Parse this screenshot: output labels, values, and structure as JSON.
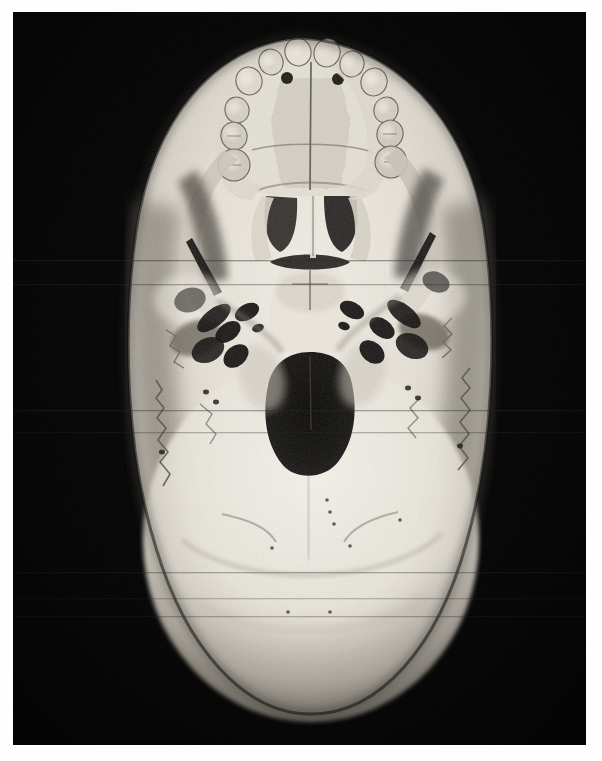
{
  "page": {
    "background_color": "#ffffff",
    "width": 602,
    "height": 761,
    "caption": ""
  },
  "photograph": {
    "name": "human-skull-base-inferior-view",
    "description": "Black and white anatomical photograph of a dry human skull viewed from below (norma basalis), lit from above, on a black background",
    "frame": {
      "x": 13,
      "y": 12,
      "width": 573,
      "height": 733
    },
    "background_color": "#070707",
    "bone_highlight_color": "#f2efe8",
    "bone_midtone_color": "#cfcac0",
    "bone_shadow_color": "#8c857b",
    "cavity_color": "#151413",
    "orientation": "inferior",
    "is_grayscale": true
  },
  "anatomy": {
    "regions": [
      {
        "id": "maxilla-dental-arch",
        "label": "Maxillary dental arch with teeth",
        "x": 300,
        "y": 110
      },
      {
        "id": "hard-palate",
        "label": "Hard palate and median palatine suture",
        "x": 300,
        "y": 175
      },
      {
        "id": "choanae",
        "label": "Posterior nasal apertures (choanae)",
        "x": 300,
        "y": 235
      },
      {
        "id": "vomer",
        "label": "Vomer / nasal septum",
        "x": 302,
        "y": 240
      },
      {
        "id": "sphenoid-body",
        "label": "Body of sphenoid",
        "x": 302,
        "y": 300
      },
      {
        "id": "foramen-ovale-left",
        "label": "Foramen ovale (left)",
        "x": 247,
        "y": 318
      },
      {
        "id": "foramen-ovale-right",
        "label": "Foramen ovale (right)",
        "x": 352,
        "y": 318
      },
      {
        "id": "carotid-canal-left",
        "label": "Carotid canal (left)",
        "x": 222,
        "y": 335
      },
      {
        "id": "carotid-canal-right",
        "label": "Carotid canal (right)",
        "x": 382,
        "y": 333
      },
      {
        "id": "jugular-foramen-left",
        "label": "Jugular foramen (left)",
        "x": 233,
        "y": 355
      },
      {
        "id": "jugular-foramen-right",
        "label": "Jugular foramen (right)",
        "x": 372,
        "y": 352
      },
      {
        "id": "foramen-magnum",
        "label": "Foramen magnum",
        "x": 310,
        "y": 420
      },
      {
        "id": "occipital-condyle-left",
        "label": "Occipital condyle (left)",
        "x": 262,
        "y": 390
      },
      {
        "id": "occipital-condyle-right",
        "label": "Occipital condyle (right)",
        "x": 362,
        "y": 385
      },
      {
        "id": "occipital-squama",
        "label": "Squamous part of occipital bone with nuchal lines",
        "x": 310,
        "y": 570
      },
      {
        "id": "zygomatic-arch-left",
        "label": "Zygomatic arch (left)",
        "x": 175,
        "y": 250
      },
      {
        "id": "zygomatic-arch-right",
        "label": "Zygomatic arch (right)",
        "x": 440,
        "y": 245
      },
      {
        "id": "mandibular-fossa-left",
        "label": "Mandibular fossa (left)",
        "x": 195,
        "y": 330
      },
      {
        "id": "mandibular-fossa-right",
        "label": "Mandibular fossa (right)",
        "x": 420,
        "y": 325
      },
      {
        "id": "mastoid-process-left",
        "label": "Mastoid process (left)",
        "x": 205,
        "y": 385
      },
      {
        "id": "mastoid-process-right",
        "label": "Mastoid process (right)",
        "x": 415,
        "y": 380
      }
    ],
    "teeth": [
      {
        "id": "incisor-upper-left-central",
        "cx": 298,
        "cy": 52,
        "rx": 13,
        "ry": 14,
        "tone": "#e8e3d8"
      },
      {
        "id": "incisor-upper-right-central",
        "cx": 327,
        "cy": 53,
        "rx": 13,
        "ry": 14,
        "tone": "#e4dfd4"
      },
      {
        "id": "incisor-upper-left-lateral",
        "cx": 271,
        "cy": 62,
        "rx": 12,
        "ry": 13,
        "tone": "#ddd8cd"
      },
      {
        "id": "incisor-upper-right-lateral",
        "cx": 352,
        "cy": 64,
        "rx": 12,
        "ry": 13,
        "tone": "#ded9ce"
      },
      {
        "id": "canine-upper-left",
        "cx": 249,
        "cy": 81,
        "rx": 13,
        "ry": 14,
        "tone": "#e0dbd0"
      },
      {
        "id": "canine-upper-right",
        "cx": 374,
        "cy": 82,
        "rx": 13,
        "ry": 14,
        "tone": "#dcd7cc"
      },
      {
        "id": "premolar-upper-left-1",
        "cx": 237,
        "cy": 110,
        "rx": 12,
        "ry": 13,
        "tone": "#d6d1c6"
      },
      {
        "id": "premolar-upper-right-1",
        "cx": 386,
        "cy": 110,
        "rx": 12,
        "ry": 13,
        "tone": "#d4cfc4"
      },
      {
        "id": "premolar-upper-left-2",
        "cx": 234,
        "cy": 136,
        "rx": 13,
        "ry": 14,
        "tone": "#d2cdc2"
      },
      {
        "id": "premolar-upper-right-2",
        "cx": 390,
        "cy": 134,
        "rx": 13,
        "ry": 14,
        "tone": "#d0cbc0"
      },
      {
        "id": "molar-upper-left-1",
        "cx": 234,
        "cy": 165,
        "rx": 16,
        "ry": 16,
        "tone": "#cfcabf"
      },
      {
        "id": "molar-upper-right-1",
        "cx": 391,
        "cy": 162,
        "rx": 16,
        "ry": 16,
        "tone": "#cdc8bd"
      }
    ],
    "foramina": [
      {
        "id": "incisive-foramen-left",
        "cx": 287,
        "cy": 78,
        "rx": 6,
        "ry": 6
      },
      {
        "id": "incisive-foramen-right",
        "cx": 338,
        "cy": 79,
        "rx": 6,
        "ry": 6
      },
      {
        "id": "greater-palatine-left",
        "cx": 279,
        "cy": 61,
        "rx": 4,
        "ry": 4
      },
      {
        "id": "greater-palatine-right",
        "cx": 344,
        "cy": 62,
        "rx": 4,
        "ry": 4
      }
    ]
  }
}
